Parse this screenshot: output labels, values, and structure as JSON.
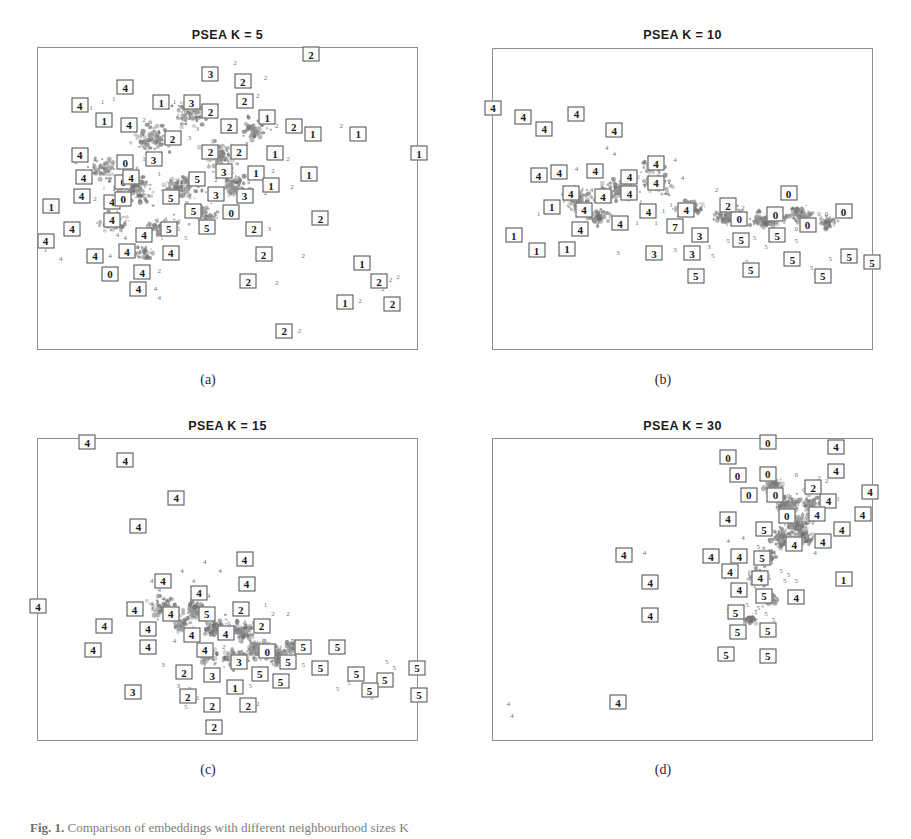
{
  "figure": {
    "caption_label": "Fig. 1.",
    "caption_text": "Comparison of embeddings with different neighbourhood sizes K",
    "panels": [
      {
        "id": "a",
        "title": "PSEA  K = 5",
        "subcaption": "(a)"
      },
      {
        "id": "b",
        "title": "PSEA  K = 10",
        "subcaption": "(b)"
      },
      {
        "id": "c",
        "title": "PSEA  K = 15",
        "subcaption": "(c)"
      },
      {
        "id": "d",
        "title": "PSEA  K = 30",
        "subcaption": "(d)"
      }
    ]
  },
  "chart_data": {
    "type": "scatter",
    "xlabel": "",
    "ylabel": "",
    "grid": false,
    "legend": "none",
    "axis_ticks": "none",
    "class_labels": [
      "0",
      "1",
      "2",
      "3",
      "4",
      "5"
    ],
    "marker_style": "digit glyph; boxed digits mark highlighted exemplar points",
    "colors": {
      "frame": "#8d8d8d",
      "points": "#6e6e6e",
      "cloud": "#8b8b8b",
      "label_box": "#4a4a4a",
      "text": "#1a1a1a"
    },
    "panels": [
      {
        "id": "a",
        "title": "PSEA  K = 5",
        "xlim": [
          0,
          1
        ],
        "ylim": [
          0,
          1
        ],
        "boxed": [
          {
            "x": 0.72,
            "y": 0.02,
            "c": "2"
          },
          {
            "x": 0.455,
            "y": 0.085,
            "c": "3"
          },
          {
            "x": 0.54,
            "y": 0.11,
            "c": "2"
          },
          {
            "x": 0.23,
            "y": 0.13,
            "c": "4"
          },
          {
            "x": 0.545,
            "y": 0.175,
            "c": "2"
          },
          {
            "x": 0.325,
            "y": 0.18,
            "c": "1"
          },
          {
            "x": 0.405,
            "y": 0.18,
            "c": "3"
          },
          {
            "x": 0.11,
            "y": 0.19,
            "c": "4"
          },
          {
            "x": 0.455,
            "y": 0.21,
            "c": "2"
          },
          {
            "x": 0.605,
            "y": 0.23,
            "c": "1"
          },
          {
            "x": 0.175,
            "y": 0.24,
            "c": "1"
          },
          {
            "x": 0.24,
            "y": 0.255,
            "c": "4"
          },
          {
            "x": 0.505,
            "y": 0.26,
            "c": "2"
          },
          {
            "x": 0.675,
            "y": 0.26,
            "c": "2"
          },
          {
            "x": 0.725,
            "y": 0.285,
            "c": "1"
          },
          {
            "x": 0.845,
            "y": 0.285,
            "c": "1"
          },
          {
            "x": 0.355,
            "y": 0.3,
            "c": "2"
          },
          {
            "x": 0.455,
            "y": 0.345,
            "c": "2"
          },
          {
            "x": 0.53,
            "y": 0.345,
            "c": "2"
          },
          {
            "x": 0.11,
            "y": 0.355,
            "c": "4"
          },
          {
            "x": 0.625,
            "y": 0.35,
            "c": "1"
          },
          {
            "x": 1.005,
            "y": 0.35,
            "c": "1"
          },
          {
            "x": 0.305,
            "y": 0.37,
            "c": "3"
          },
          {
            "x": 0.23,
            "y": 0.38,
            "c": "0"
          },
          {
            "x": 0.49,
            "y": 0.41,
            "c": "3"
          },
          {
            "x": 0.575,
            "y": 0.415,
            "c": "1"
          },
          {
            "x": 0.12,
            "y": 0.43,
            "c": "4"
          },
          {
            "x": 0.225,
            "y": 0.445,
            "c": "0"
          },
          {
            "x": 0.245,
            "y": 0.43,
            "c": "4"
          },
          {
            "x": 0.715,
            "y": 0.42,
            "c": "1"
          },
          {
            "x": 0.615,
            "y": 0.455,
            "c": "1"
          },
          {
            "x": 0.42,
            "y": 0.435,
            "c": "5"
          },
          {
            "x": 0.115,
            "y": 0.49,
            "c": "4"
          },
          {
            "x": 0.195,
            "y": 0.51,
            "c": "4"
          },
          {
            "x": 0.225,
            "y": 0.5,
            "c": "0"
          },
          {
            "x": 0.35,
            "y": 0.495,
            "c": "5"
          },
          {
            "x": 0.47,
            "y": 0.485,
            "c": "3"
          },
          {
            "x": 0.545,
            "y": 0.49,
            "c": "3"
          },
          {
            "x": 0.035,
            "y": 0.525,
            "c": "1"
          },
          {
            "x": 0.195,
            "y": 0.57,
            "c": "4"
          },
          {
            "x": 0.41,
            "y": 0.54,
            "c": "5"
          },
          {
            "x": 0.51,
            "y": 0.545,
            "c": "0"
          },
          {
            "x": 0.09,
            "y": 0.6,
            "c": "4"
          },
          {
            "x": 0.28,
            "y": 0.62,
            "c": "4"
          },
          {
            "x": 0.345,
            "y": 0.6,
            "c": "5"
          },
          {
            "x": 0.445,
            "y": 0.595,
            "c": "5"
          },
          {
            "x": 0.57,
            "y": 0.6,
            "c": "2"
          },
          {
            "x": 0.745,
            "y": 0.565,
            "c": "2"
          },
          {
            "x": 0.235,
            "y": 0.675,
            "c": "4"
          },
          {
            "x": 0.35,
            "y": 0.68,
            "c": "4"
          },
          {
            "x": 0.15,
            "y": 0.69,
            "c": "4"
          },
          {
            "x": 0.595,
            "y": 0.685,
            "c": "2"
          },
          {
            "x": 0.02,
            "y": 0.64,
            "c": "4"
          },
          {
            "x": 0.19,
            "y": 0.75,
            "c": "0"
          },
          {
            "x": 0.275,
            "y": 0.745,
            "c": "4"
          },
          {
            "x": 0.265,
            "y": 0.8,
            "c": "4"
          },
          {
            "x": 0.555,
            "y": 0.775,
            "c": "2"
          },
          {
            "x": 0.855,
            "y": 0.715,
            "c": "1"
          },
          {
            "x": 0.9,
            "y": 0.775,
            "c": "2"
          },
          {
            "x": 0.81,
            "y": 0.845,
            "c": "1"
          },
          {
            "x": 0.935,
            "y": 0.85,
            "c": "2"
          },
          {
            "x": 0.65,
            "y": 0.94,
            "c": "2"
          }
        ]
      },
      {
        "id": "b",
        "title": "PSEA  K = 10",
        "xlim": [
          0,
          1
        ],
        "ylim": [
          0,
          1
        ],
        "boxed": [
          {
            "x": 0.0,
            "y": 0.195,
            "c": "4"
          },
          {
            "x": 0.08,
            "y": 0.225,
            "c": "4"
          },
          {
            "x": 0.135,
            "y": 0.265,
            "c": "4"
          },
          {
            "x": 0.22,
            "y": 0.215,
            "c": "4"
          },
          {
            "x": 0.32,
            "y": 0.27,
            "c": "4"
          },
          {
            "x": 0.43,
            "y": 0.38,
            "c": "4"
          },
          {
            "x": 0.43,
            "y": 0.445,
            "c": "4"
          },
          {
            "x": 0.12,
            "y": 0.42,
            "c": "4"
          },
          {
            "x": 0.175,
            "y": 0.41,
            "c": "4"
          },
          {
            "x": 0.27,
            "y": 0.405,
            "c": "4"
          },
          {
            "x": 0.36,
            "y": 0.425,
            "c": "4"
          },
          {
            "x": 0.36,
            "y": 0.48,
            "c": "4"
          },
          {
            "x": 0.205,
            "y": 0.48,
            "c": "4"
          },
          {
            "x": 0.29,
            "y": 0.49,
            "c": "4"
          },
          {
            "x": 0.155,
            "y": 0.525,
            "c": "1"
          },
          {
            "x": 0.24,
            "y": 0.535,
            "c": "4"
          },
          {
            "x": 0.41,
            "y": 0.54,
            "c": "4"
          },
          {
            "x": 0.335,
            "y": 0.58,
            "c": "4"
          },
          {
            "x": 0.23,
            "y": 0.6,
            "c": "4"
          },
          {
            "x": 0.51,
            "y": 0.535,
            "c": "4"
          },
          {
            "x": 0.48,
            "y": 0.59,
            "c": "7"
          },
          {
            "x": 0.62,
            "y": 0.52,
            "c": "2"
          },
          {
            "x": 0.545,
            "y": 0.62,
            "c": "3"
          },
          {
            "x": 0.65,
            "y": 0.565,
            "c": "0"
          },
          {
            "x": 0.745,
            "y": 0.55,
            "c": "0"
          },
          {
            "x": 0.78,
            "y": 0.48,
            "c": "0"
          },
          {
            "x": 0.83,
            "y": 0.585,
            "c": "0"
          },
          {
            "x": 0.925,
            "y": 0.54,
            "c": "0"
          },
          {
            "x": 0.655,
            "y": 0.635,
            "c": "5"
          },
          {
            "x": 0.75,
            "y": 0.62,
            "c": "5"
          },
          {
            "x": 0.055,
            "y": 0.62,
            "c": "1"
          },
          {
            "x": 0.115,
            "y": 0.67,
            "c": "1"
          },
          {
            "x": 0.195,
            "y": 0.665,
            "c": "1"
          },
          {
            "x": 0.425,
            "y": 0.68,
            "c": "3"
          },
          {
            "x": 0.525,
            "y": 0.68,
            "c": "3"
          },
          {
            "x": 0.535,
            "y": 0.755,
            "c": "5"
          },
          {
            "x": 0.68,
            "y": 0.735,
            "c": "5"
          },
          {
            "x": 0.79,
            "y": 0.7,
            "c": "5"
          },
          {
            "x": 0.87,
            "y": 0.755,
            "c": "5"
          },
          {
            "x": 0.94,
            "y": 0.69,
            "c": "5"
          },
          {
            "x": 1.0,
            "y": 0.71,
            "c": "5"
          }
        ]
      },
      {
        "id": "c",
        "title": "PSEA  K = 15",
        "xlim": [
          0,
          1
        ],
        "ylim": [
          0,
          1
        ],
        "boxed": [
          {
            "x": 0.13,
            "y": 0.01,
            "c": "4"
          },
          {
            "x": 0.23,
            "y": 0.07,
            "c": "4"
          },
          {
            "x": 0.365,
            "y": 0.195,
            "c": "4"
          },
          {
            "x": 0.265,
            "y": 0.29,
            "c": "4"
          },
          {
            "x": 0.545,
            "y": 0.4,
            "c": "4"
          },
          {
            "x": 0.55,
            "y": 0.48,
            "c": "4"
          },
          {
            "x": 0.33,
            "y": 0.47,
            "c": "4"
          },
          {
            "x": 0.425,
            "y": 0.51,
            "c": "4"
          },
          {
            "x": 0.255,
            "y": 0.565,
            "c": "4"
          },
          {
            "x": 0.35,
            "y": 0.58,
            "c": "4"
          },
          {
            "x": 0.445,
            "y": 0.58,
            "c": "5"
          },
          {
            "x": 0.535,
            "y": 0.565,
            "c": "2"
          },
          {
            "x": 0.175,
            "y": 0.62,
            "c": "4"
          },
          {
            "x": 0.29,
            "y": 0.63,
            "c": "4"
          },
          {
            "x": 0.405,
            "y": 0.65,
            "c": "4"
          },
          {
            "x": 0.495,
            "y": 0.645,
            "c": "4"
          },
          {
            "x": 0.59,
            "y": 0.62,
            "c": "2"
          },
          {
            "x": 0.0,
            "y": 0.555,
            "c": "4"
          },
          {
            "x": 0.145,
            "y": 0.7,
            "c": "4"
          },
          {
            "x": 0.29,
            "y": 0.69,
            "c": "4"
          },
          {
            "x": 0.44,
            "y": 0.7,
            "c": "4"
          },
          {
            "x": 0.53,
            "y": 0.74,
            "c": "3"
          },
          {
            "x": 0.605,
            "y": 0.705,
            "c": "0"
          },
          {
            "x": 0.7,
            "y": 0.69,
            "c": "5"
          },
          {
            "x": 0.79,
            "y": 0.69,
            "c": "5"
          },
          {
            "x": 0.66,
            "y": 0.74,
            "c": "5"
          },
          {
            "x": 0.385,
            "y": 0.775,
            "c": "2"
          },
          {
            "x": 0.46,
            "y": 0.785,
            "c": "3"
          },
          {
            "x": 0.585,
            "y": 0.78,
            "c": "5"
          },
          {
            "x": 0.745,
            "y": 0.76,
            "c": "5"
          },
          {
            "x": 0.84,
            "y": 0.78,
            "c": "5"
          },
          {
            "x": 0.915,
            "y": 0.8,
            "c": "5"
          },
          {
            "x": 0.875,
            "y": 0.835,
            "c": "5"
          },
          {
            "x": 1.0,
            "y": 0.76,
            "c": "5"
          },
          {
            "x": 1.005,
            "y": 0.85,
            "c": "5"
          },
          {
            "x": 0.25,
            "y": 0.84,
            "c": "3"
          },
          {
            "x": 0.395,
            "y": 0.855,
            "c": "2"
          },
          {
            "x": 0.52,
            "y": 0.825,
            "c": "1"
          },
          {
            "x": 0.64,
            "y": 0.805,
            "c": "5"
          },
          {
            "x": 0.46,
            "y": 0.885,
            "c": "2"
          },
          {
            "x": 0.555,
            "y": 0.885,
            "c": "2"
          },
          {
            "x": 0.465,
            "y": 0.955,
            "c": "2"
          }
        ]
      },
      {
        "id": "d",
        "title": "PSEA  K = 30",
        "xlim": [
          0,
          1
        ],
        "ylim": [
          0,
          1
        ],
        "boxed": [
          {
            "x": 0.725,
            "y": 0.01,
            "c": "0"
          },
          {
            "x": 0.905,
            "y": 0.025,
            "c": "4"
          },
          {
            "x": 0.62,
            "y": 0.06,
            "c": "0"
          },
          {
            "x": 0.645,
            "y": 0.12,
            "c": "0"
          },
          {
            "x": 0.725,
            "y": 0.115,
            "c": "0"
          },
          {
            "x": 0.905,
            "y": 0.105,
            "c": "4"
          },
          {
            "x": 0.675,
            "y": 0.185,
            "c": "0"
          },
          {
            "x": 0.745,
            "y": 0.185,
            "c": "0"
          },
          {
            "x": 0.845,
            "y": 0.16,
            "c": "2"
          },
          {
            "x": 0.885,
            "y": 0.205,
            "c": "4"
          },
          {
            "x": 0.995,
            "y": 0.175,
            "c": "4"
          },
          {
            "x": 0.775,
            "y": 0.255,
            "c": "0"
          },
          {
            "x": 0.855,
            "y": 0.25,
            "c": "4"
          },
          {
            "x": 0.975,
            "y": 0.25,
            "c": "4"
          },
          {
            "x": 0.62,
            "y": 0.265,
            "c": "4"
          },
          {
            "x": 0.715,
            "y": 0.3,
            "c": "5"
          },
          {
            "x": 0.92,
            "y": 0.3,
            "c": "4"
          },
          {
            "x": 0.87,
            "y": 0.34,
            "c": "4"
          },
          {
            "x": 0.795,
            "y": 0.35,
            "c": "4"
          },
          {
            "x": 0.575,
            "y": 0.39,
            "c": "4"
          },
          {
            "x": 0.65,
            "y": 0.39,
            "c": "4"
          },
          {
            "x": 0.71,
            "y": 0.395,
            "c": "5"
          },
          {
            "x": 0.345,
            "y": 0.385,
            "c": "4"
          },
          {
            "x": 0.415,
            "y": 0.475,
            "c": "4"
          },
          {
            "x": 0.625,
            "y": 0.44,
            "c": "4"
          },
          {
            "x": 0.705,
            "y": 0.46,
            "c": "4"
          },
          {
            "x": 0.925,
            "y": 0.465,
            "c": "1"
          },
          {
            "x": 0.65,
            "y": 0.5,
            "c": "4"
          },
          {
            "x": 0.715,
            "y": 0.52,
            "c": "5"
          },
          {
            "x": 0.8,
            "y": 0.525,
            "c": "4"
          },
          {
            "x": 0.415,
            "y": 0.585,
            "c": "4"
          },
          {
            "x": 0.64,
            "y": 0.575,
            "c": "5"
          },
          {
            "x": 0.645,
            "y": 0.64,
            "c": "5"
          },
          {
            "x": 0.725,
            "y": 0.635,
            "c": "5"
          },
          {
            "x": 0.615,
            "y": 0.715,
            "c": "5"
          },
          {
            "x": 0.725,
            "y": 0.72,
            "c": "5"
          },
          {
            "x": 0.33,
            "y": 0.875,
            "c": "4"
          }
        ]
      }
    ]
  }
}
